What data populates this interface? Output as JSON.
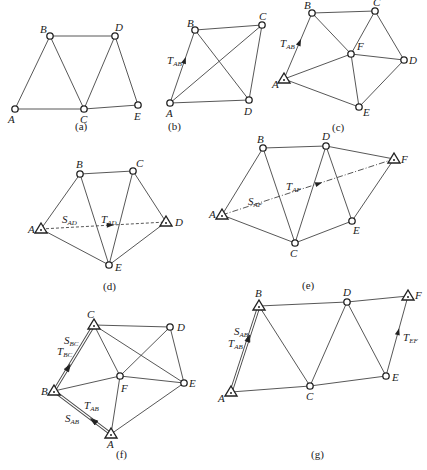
{
  "figure": {
    "panels": [
      {
        "id": "a",
        "caption": "(a)",
        "nodes": [
          {
            "name": "A",
            "x": 15,
            "y": 109,
            "type": "circle",
            "lx": 8,
            "ly": 123
          },
          {
            "name": "B",
            "x": 50,
            "y": 36,
            "type": "circle",
            "lx": 40,
            "ly": 33
          },
          {
            "name": "D",
            "x": 115,
            "y": 36,
            "type": "circle",
            "lx": 115,
            "ly": 31
          },
          {
            "name": "C",
            "x": 84,
            "y": 109,
            "type": "circle",
            "lx": 80,
            "ly": 123
          },
          {
            "name": "E",
            "x": 138,
            "y": 105,
            "type": "circle",
            "lx": 134,
            "ly": 120
          }
        ],
        "edges": [
          [
            "A",
            "B"
          ],
          [
            "A",
            "C"
          ],
          [
            "B",
            "C"
          ],
          [
            "B",
            "D"
          ],
          [
            "C",
            "D"
          ],
          [
            "D",
            "E"
          ],
          [
            "C",
            "E"
          ]
        ],
        "caption_pos": [
          75,
          130
        ]
      },
      {
        "id": "b",
        "caption": "(b)",
        "nodes": [
          {
            "name": "A",
            "x": 170,
            "y": 103,
            "type": "circle",
            "lx": 166,
            "ly": 117
          },
          {
            "name": "B",
            "x": 195,
            "y": 30,
            "type": "circle",
            "lx": 187,
            "ly": 27
          },
          {
            "name": "C",
            "x": 262,
            "y": 25,
            "type": "circle",
            "lx": 259,
            "ly": 20
          },
          {
            "name": "D",
            "x": 249,
            "y": 100,
            "type": "circle",
            "lx": 244,
            "ly": 115
          }
        ],
        "edges": [
          [
            "A",
            "B"
          ],
          [
            "B",
            "C"
          ],
          [
            "A",
            "C"
          ],
          [
            "B",
            "D"
          ],
          [
            "C",
            "D"
          ],
          [
            "A",
            "D"
          ]
        ],
        "annotations": [
          {
            "main": "T",
            "sub": "AB",
            "x": 167,
            "y": 64
          }
        ],
        "arrows": [
          {
            "from": "A",
            "to": "B",
            "t": 0.58
          }
        ],
        "caption_pos": [
          168,
          130
        ]
      },
      {
        "id": "c",
        "caption": "(c)",
        "nodes": [
          {
            "name": "A",
            "x": 284,
            "y": 79,
            "type": "triangle",
            "lx": 272,
            "ly": 88
          },
          {
            "name": "B",
            "x": 312,
            "y": 13,
            "type": "circle",
            "lx": 304,
            "ly": 9
          },
          {
            "name": "C",
            "x": 375,
            "y": 11,
            "type": "circle",
            "lx": 373,
            "ly": 6
          },
          {
            "name": "F",
            "x": 351,
            "y": 54,
            "type": "circle",
            "lx": 357,
            "ly": 50
          },
          {
            "name": "D",
            "x": 404,
            "y": 60,
            "type": "circle",
            "lx": 409,
            "ly": 64
          },
          {
            "name": "E",
            "x": 359,
            "y": 107,
            "type": "circle",
            "lx": 363,
            "ly": 116
          }
        ],
        "edges": [
          [
            "A",
            "B"
          ],
          [
            "B",
            "C"
          ],
          [
            "B",
            "F"
          ],
          [
            "C",
            "F"
          ],
          [
            "C",
            "D"
          ],
          [
            "F",
            "D"
          ],
          [
            "A",
            "F"
          ],
          [
            "F",
            "E"
          ],
          [
            "A",
            "E"
          ],
          [
            "E",
            "D"
          ]
        ],
        "annotations": [
          {
            "main": "T",
            "sub": "AB",
            "x": 280,
            "y": 47
          }
        ],
        "arrows": [
          {
            "from": "A",
            "to": "B",
            "t": 0.55
          }
        ],
        "caption_pos": [
          332,
          131
        ]
      },
      {
        "id": "d",
        "caption": "(d)",
        "nodes": [
          {
            "name": "A",
            "x": 41,
            "y": 229,
            "type": "triangle",
            "lx": 28,
            "ly": 233
          },
          {
            "name": "B",
            "x": 80,
            "y": 174,
            "type": "circle",
            "lx": 76,
            "ly": 168
          },
          {
            "name": "C",
            "x": 133,
            "y": 171,
            "type": "circle",
            "lx": 136,
            "ly": 167
          },
          {
            "name": "D",
            "x": 166,
            "y": 222,
            "type": "triangle",
            "lx": 175,
            "ly": 226
          },
          {
            "name": "E",
            "x": 109,
            "y": 265,
            "type": "circle",
            "lx": 115,
            "ly": 271
          }
        ],
        "edges": [
          [
            "A",
            "B"
          ],
          [
            "B",
            "C"
          ],
          [
            "C",
            "D"
          ],
          [
            "B",
            "E"
          ],
          [
            "C",
            "E"
          ],
          [
            "A",
            "E"
          ],
          [
            "D",
            "E"
          ]
        ],
        "dashed": [
          [
            "A",
            "D"
          ]
        ],
        "annotations": [
          {
            "main": "S",
            "sub": "AD",
            "x": 62,
            "y": 223
          },
          {
            "main": "T",
            "sub": "AD",
            "x": 101,
            "y": 223
          }
        ],
        "arrows": [
          {
            "from": "A",
            "to": "D",
            "t": 0.55
          }
        ],
        "caption_pos": [
          103,
          290
        ]
      },
      {
        "id": "e",
        "caption": "(e)",
        "nodes": [
          {
            "name": "A",
            "x": 222,
            "y": 215,
            "type": "triangle",
            "lx": 209,
            "ly": 218
          },
          {
            "name": "B",
            "x": 263,
            "y": 148,
            "type": "circle",
            "lx": 257,
            "ly": 143
          },
          {
            "name": "D",
            "x": 326,
            "y": 146,
            "type": "circle",
            "lx": 322,
            "ly": 140
          },
          {
            "name": "F",
            "x": 394,
            "y": 159,
            "type": "triangle",
            "lx": 401,
            "ly": 163
          },
          {
            "name": "E",
            "x": 352,
            "y": 221,
            "type": "circle",
            "lx": 353,
            "ly": 234
          },
          {
            "name": "C",
            "x": 295,
            "y": 243,
            "type": "circle",
            "lx": 290,
            "ly": 257
          }
        ],
        "edges": [
          [
            "A",
            "B"
          ],
          [
            "B",
            "D"
          ],
          [
            "D",
            "F"
          ],
          [
            "B",
            "C"
          ],
          [
            "C",
            "D"
          ],
          [
            "D",
            "E"
          ],
          [
            "E",
            "F"
          ],
          [
            "A",
            "C"
          ],
          [
            "C",
            "E"
          ]
        ],
        "dashdot": [
          [
            "A",
            "F"
          ]
        ],
        "annotations": [
          {
            "main": "S",
            "sub": "AF",
            "x": 248,
            "y": 205
          },
          {
            "main": "T",
            "sub": "AF",
            "x": 286,
            "y": 190
          }
        ],
        "arrows": [
          {
            "from": "A",
            "to": "F",
            "t": 0.56
          }
        ],
        "caption_pos": [
          302,
          289
        ]
      },
      {
        "id": "f",
        "caption": "(f)",
        "nodes": [
          {
            "name": "C",
            "x": 94,
            "y": 325,
            "type": "triangle",
            "lx": 87,
            "ly": 318
          },
          {
            "name": "D",
            "x": 170,
            "y": 327,
            "type": "circle",
            "lx": 177,
            "ly": 331
          },
          {
            "name": "F",
            "x": 120,
            "y": 376,
            "type": "circle",
            "lx": 121,
            "ly": 392
          },
          {
            "name": "E",
            "x": 184,
            "y": 383,
            "type": "circle",
            "lx": 189,
            "ly": 387
          },
          {
            "name": "B",
            "x": 54,
            "y": 391,
            "type": "triangle",
            "lx": 41,
            "ly": 395
          },
          {
            "name": "A",
            "x": 111,
            "y": 434,
            "type": "triangle",
            "lx": 107,
            "ly": 448
          }
        ],
        "edges": [
          [
            "C",
            "D"
          ],
          [
            "C",
            "F"
          ],
          [
            "C",
            "E"
          ],
          [
            "D",
            "F"
          ],
          [
            "D",
            "E"
          ],
          [
            "B",
            "F"
          ],
          [
            "F",
            "E"
          ],
          [
            "F",
            "A"
          ],
          [
            "A",
            "E"
          ]
        ],
        "double": [
          [
            "B",
            "C"
          ],
          [
            "B",
            "A"
          ]
        ],
        "annotations": [
          {
            "main": "S",
            "sub": "BC",
            "x": 64,
            "y": 344
          },
          {
            "main": "T",
            "sub": "BC",
            "x": 57,
            "y": 355
          },
          {
            "main": "T",
            "sub": "AB",
            "x": 84,
            "y": 409
          },
          {
            "main": "S",
            "sub": "AB",
            "x": 65,
            "y": 422
          }
        ],
        "arrows": [
          {
            "from": "B",
            "to": "C",
            "t": 0.35,
            "open": true
          },
          {
            "from": "A",
            "to": "B",
            "t": 0.3,
            "open": true
          }
        ],
        "caption_pos": [
          116,
          458
        ]
      },
      {
        "id": "g",
        "caption": "(g)",
        "nodes": [
          {
            "name": "B",
            "x": 259,
            "y": 306,
            "type": "triangle",
            "lx": 255,
            "ly": 297
          },
          {
            "name": "D",
            "x": 347,
            "y": 302,
            "type": "circle",
            "lx": 343,
            "ly": 296
          },
          {
            "name": "F",
            "x": 408,
            "y": 296,
            "type": "triangle",
            "lx": 415,
            "ly": 299
          },
          {
            "name": "E",
            "x": 386,
            "y": 376,
            "type": "circle",
            "lx": 392,
            "ly": 381
          },
          {
            "name": "C",
            "x": 310,
            "y": 386,
            "type": "circle",
            "lx": 306,
            "ly": 400
          },
          {
            "name": "A",
            "x": 231,
            "y": 392,
            "type": "triangle",
            "lx": 218,
            "ly": 402
          }
        ],
        "edges": [
          [
            "B",
            "D"
          ],
          [
            "D",
            "F"
          ],
          [
            "B",
            "C"
          ],
          [
            "C",
            "D"
          ],
          [
            "D",
            "E"
          ],
          [
            "A",
            "C"
          ],
          [
            "C",
            "E"
          ],
          [
            "E",
            "F"
          ]
        ],
        "double": [
          [
            "A",
            "B"
          ]
        ],
        "annotations": [
          {
            "main": "S",
            "sub": "AB",
            "x": 234,
            "y": 335
          },
          {
            "main": "T",
            "sub": "AB",
            "x": 228,
            "y": 347
          },
          {
            "main": "T",
            "sub": "EF",
            "x": 403,
            "y": 341
          }
        ],
        "arrows": [
          {
            "from": "A",
            "to": "B",
            "t": 0.62,
            "open": true
          },
          {
            "from": "E",
            "to": "F",
            "t": 0.55
          }
        ],
        "caption_pos": [
          311,
          458
        ]
      }
    ]
  }
}
